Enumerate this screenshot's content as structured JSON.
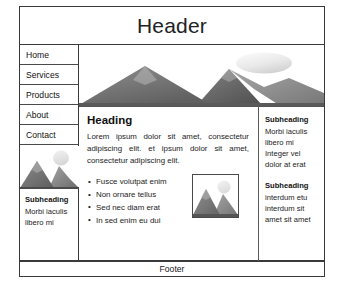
{
  "header": {
    "title": "Header"
  },
  "nav": {
    "items": [
      {
        "label": "Home"
      },
      {
        "label": "Services"
      },
      {
        "label": "Products"
      },
      {
        "label": "About"
      },
      {
        "label": "Contact"
      }
    ]
  },
  "left_sidebar": {
    "image_name": "mountain-sun-image",
    "block": {
      "subheading": "Subheading",
      "lines": [
        "Morbi iaculis",
        "libero mi"
      ]
    }
  },
  "hero": {
    "image_name": "mountain-landscape-banner"
  },
  "main": {
    "heading": "Heading",
    "paragraph": "Lorem ipsum  dolor sit amet, consectetur adipiscing elit. et ipsum  dolor sit amet, consectetur  adipiscing elit.",
    "bullets": [
      "Fusce volutpat enim",
      "Non ornare tellus",
      "Sed nec diam erat",
      "In sed enim eu dui"
    ],
    "inline_image_name": "mountain-sun-thumbnail"
  },
  "right_sidebar": {
    "blocks": [
      {
        "subheading": "Subheading",
        "lines": [
          "Morbi iaculis",
          "libero mi",
          "Integer vel",
          "dolor at erat"
        ]
      },
      {
        "subheading": "Subheading",
        "lines": [
          "interdum etu",
          "interdum sit",
          "amet sit amet"
        ]
      }
    ]
  },
  "footer": {
    "text": "Footer"
  },
  "colors": {
    "border": "#3a3a3a",
    "divider": "#4a4a4a",
    "text": "#1a1a1a",
    "background": "#ffffff",
    "mountain_dark": "#5e5e5e",
    "mountain_light": "#9a9a9a",
    "sun": "#e8e8e8"
  }
}
